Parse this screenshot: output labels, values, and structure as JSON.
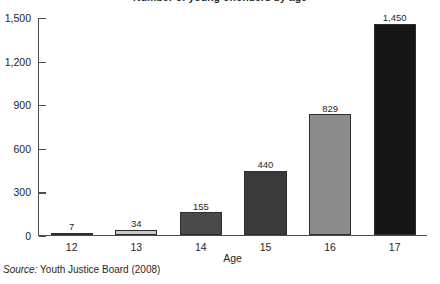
{
  "chart_data": {
    "type": "bar",
    "title": "Number of young offenders by age",
    "title_cropped": true,
    "categories": [
      "12",
      "13",
      "14",
      "15",
      "16",
      "17"
    ],
    "values": [
      7,
      34,
      155,
      440,
      829,
      1450
    ],
    "value_labels": [
      "7",
      "34",
      "155",
      "440",
      "829",
      "1,450"
    ],
    "bar_colors": [
      "#2b2b2b",
      "#c9c9c9",
      "#4a4a4a",
      "#3a3a3a",
      "#8c8c8c",
      "#161616"
    ],
    "bar_outline": "#2e2e2e",
    "xlabel": "Age",
    "ylabel": "",
    "ylim": [
      0,
      1500
    ],
    "yticks": [
      0,
      300,
      600,
      900,
      1200,
      1500
    ],
    "ytick_labels": [
      "0",
      "300",
      "600",
      "900",
      "1,200",
      "1,500"
    ],
    "grid": false,
    "legend": false,
    "axis_color": "#4d4d4d"
  },
  "source": {
    "label": "Source:",
    "text": " Youth Justice Board (2008)"
  }
}
